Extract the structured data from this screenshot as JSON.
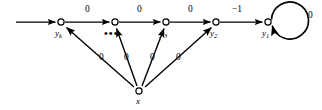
{
  "figure": {
    "type": "directed-graph-diagram",
    "background_color": "#ffffff",
    "stroke_color": "#000000",
    "nodes": [
      {
        "id": "yk",
        "label_base": "y",
        "label_sub": "k",
        "x": 61,
        "y": 22
      },
      {
        "id": "ydots",
        "label_base": "",
        "label_sub": "",
        "x": 115,
        "y": 22
      },
      {
        "id": "y3",
        "label_base": "y",
        "label_sub": "3",
        "x": 166,
        "y": 22
      },
      {
        "id": "y2",
        "label_base": "y",
        "label_sub": "2",
        "x": 216,
        "y": 22
      },
      {
        "id": "y1",
        "label_base": "y",
        "label_sub": "1",
        "x": 268,
        "y": 22
      },
      {
        "id": "x",
        "label_base": "x",
        "label_sub": "",
        "x": 139,
        "y": 91
      }
    ],
    "ellipsis": {
      "text": "•••",
      "x": 106,
      "y": 30
    },
    "edges": [
      {
        "from": "entry",
        "to": "yk",
        "weight": ""
      },
      {
        "from": "yk",
        "to": "ydots",
        "weight": "0"
      },
      {
        "from": "ydots",
        "to": "y3",
        "weight": "0"
      },
      {
        "from": "y3",
        "to": "y2",
        "weight": "0"
      },
      {
        "from": "y2",
        "to": "y1",
        "weight": "−1"
      },
      {
        "from": "y1",
        "to": "y1",
        "weight": "0",
        "self_loop": true
      },
      {
        "from": "x",
        "to": "yk",
        "weight": "0"
      },
      {
        "from": "x",
        "to": "ydots",
        "weight": "0"
      },
      {
        "from": "x",
        "to": "y3",
        "weight": "0"
      },
      {
        "from": "x",
        "to": "y2",
        "weight": "0"
      }
    ],
    "edge_weight_labels": [
      {
        "name": "weight-yk-to-dots",
        "text": "0",
        "x": 85,
        "y": 6
      },
      {
        "name": "weight-dots-to-y3",
        "text": "0",
        "x": 137,
        "y": 6
      },
      {
        "name": "weight-y3-to-y2",
        "text": "0",
        "x": 188,
        "y": 6
      },
      {
        "name": "weight-y2-to-y1",
        "text": "−1",
        "x": 234,
        "y": 6
      },
      {
        "name": "weight-y1-self-loop",
        "text": "0",
        "x": 309,
        "y": 12
      },
      {
        "name": "weight-x-to-yk",
        "text": "0",
        "x": 100,
        "y": 54
      },
      {
        "name": "weight-x-to-dots",
        "text": "0",
        "x": 124,
        "y": 54
      },
      {
        "name": "weight-x-to-y3",
        "text": "0",
        "x": 150,
        "y": 54
      },
      {
        "name": "weight-x-to-y2",
        "text": "0",
        "x": 176,
        "y": 54
      }
    ],
    "node_text_labels": [
      {
        "name": "node-label-yk",
        "base": "y",
        "sub": "k",
        "x": 55,
        "y": 30
      },
      {
        "name": "node-label-y3",
        "base": "y",
        "sub": "3",
        "x": 161,
        "y": 30
      },
      {
        "name": "node-label-y2",
        "base": "y",
        "sub": "2",
        "x": 211,
        "y": 30
      },
      {
        "name": "node-label-y1",
        "base": "y",
        "sub": "1",
        "x": 263,
        "y": 30
      },
      {
        "name": "node-label-x",
        "base": "x",
        "sub": "",
        "x": 136,
        "y": 98
      }
    ]
  }
}
